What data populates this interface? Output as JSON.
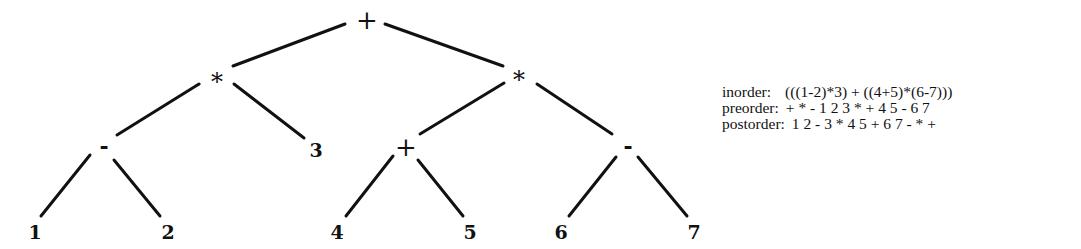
{
  "tree": {
    "edge_color": "#111111",
    "edge_width": 3,
    "nodes": [
      {
        "id": "root",
        "label": "+",
        "x": 367,
        "y": 20,
        "kind": "op-plus"
      },
      {
        "id": "left-mul",
        "label": "*",
        "x": 217,
        "y": 82,
        "kind": "op-star"
      },
      {
        "id": "right-mul",
        "label": "*",
        "x": 519,
        "y": 80,
        "kind": "op-star"
      },
      {
        "id": "left-sub",
        "label": "-",
        "x": 104,
        "y": 146,
        "kind": "op-minus"
      },
      {
        "id": "leaf-3",
        "label": "3",
        "x": 316,
        "y": 150,
        "kind": "leaf"
      },
      {
        "id": "inner-add",
        "label": "+",
        "x": 406,
        "y": 147,
        "kind": "op-plus"
      },
      {
        "id": "right-sub",
        "label": "-",
        "x": 628,
        "y": 146,
        "kind": "op-minus"
      },
      {
        "id": "leaf-1",
        "label": "1",
        "x": 35,
        "y": 232,
        "kind": "leaf"
      },
      {
        "id": "leaf-2",
        "label": "2",
        "x": 168,
        "y": 232,
        "kind": "leaf"
      },
      {
        "id": "leaf-4",
        "label": "4",
        "x": 337,
        "y": 232,
        "kind": "leaf"
      },
      {
        "id": "leaf-5",
        "label": "5",
        "x": 470,
        "y": 232,
        "kind": "leaf"
      },
      {
        "id": "leaf-6",
        "label": "6",
        "x": 561,
        "y": 232,
        "kind": "leaf"
      },
      {
        "id": "leaf-7",
        "label": "7",
        "x": 694,
        "y": 232,
        "kind": "leaf"
      }
    ],
    "edges": [
      {
        "from": "root",
        "to": "left-mul",
        "x1": 345,
        "y1": 24,
        "x2": 233,
        "y2": 66
      },
      {
        "from": "root",
        "to": "right-mul",
        "x1": 385,
        "y1": 24,
        "x2": 503,
        "y2": 66
      },
      {
        "from": "left-mul",
        "to": "left-sub",
        "x1": 199,
        "y1": 84,
        "x2": 117,
        "y2": 135
      },
      {
        "from": "left-mul",
        "to": "leaf-3",
        "x1": 234,
        "y1": 84,
        "x2": 304,
        "y2": 138
      },
      {
        "from": "right-mul",
        "to": "inner-add",
        "x1": 504,
        "y1": 83,
        "x2": 420,
        "y2": 134
      },
      {
        "from": "right-mul",
        "to": "right-sub",
        "x1": 537,
        "y1": 84,
        "x2": 612,
        "y2": 134
      },
      {
        "from": "left-sub",
        "to": "leaf-1",
        "x1": 90,
        "y1": 155,
        "x2": 41,
        "y2": 216
      },
      {
        "from": "left-sub",
        "to": "leaf-2",
        "x1": 114,
        "y1": 160,
        "x2": 160,
        "y2": 216
      },
      {
        "from": "inner-add",
        "to": "leaf-4",
        "x1": 393,
        "y1": 156,
        "x2": 346,
        "y2": 216
      },
      {
        "from": "inner-add",
        "to": "leaf-5",
        "x1": 418,
        "y1": 160,
        "x2": 463,
        "y2": 216
      },
      {
        "from": "right-sub",
        "to": "leaf-6",
        "x1": 616,
        "y1": 157,
        "x2": 569,
        "y2": 216
      },
      {
        "from": "right-sub",
        "to": "leaf-7",
        "x1": 638,
        "y1": 157,
        "x2": 687,
        "y2": 216
      }
    ]
  },
  "traversals": {
    "inorder": {
      "label": "inorder:",
      "value": "(((1-2)*3) + ((4+5)*(6-7)))"
    },
    "preorder": {
      "label": "preorder:",
      "value": "+ * - 1 2 3 * + 4 5 - 6 7"
    },
    "postorder": {
      "label": "postorder:",
      "value": "1 2 - 3 * 4 5 + 6 7 - * +"
    }
  }
}
